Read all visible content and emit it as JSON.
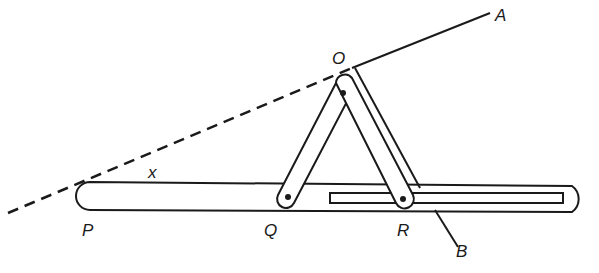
{
  "diagram": {
    "type": "mechanism",
    "labels": {
      "A": "A",
      "B": "B",
      "O": "O",
      "P": "P",
      "Q": "Q",
      "R": "R",
      "x": "x"
    },
    "colors": {
      "line": "#1a1a1a",
      "background": "#ffffff"
    }
  }
}
